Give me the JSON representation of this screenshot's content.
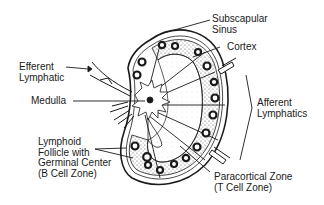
{
  "diagram": {
    "labels": {
      "subscapular_sinus": "Subscapular\nSinus",
      "cortex": "Cortex",
      "efferent_lymphatic": "Efferent\nLymphatic",
      "medulla": "Medulla",
      "afferent_lymphatics": "Afferent\nLymphatics",
      "lymphoid_follicle": "Lymphoid\nFollicle with\nGerminal Center\n(B Cell Zone)",
      "paracortical_zone": "Paracortical Zone\n(T Cell Zone)"
    },
    "colors": {
      "ink": "#1a1a1a",
      "background": "#ffffff",
      "stipple": "#bdbdbd"
    }
  }
}
